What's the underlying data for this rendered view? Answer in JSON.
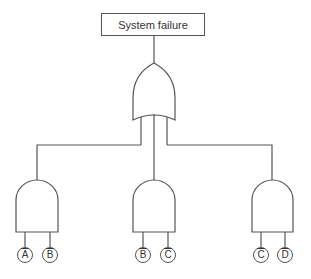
{
  "diagram": {
    "type": "fault-tree",
    "top_event": {
      "label": "System failure"
    },
    "or_gate": {
      "name": "or-gate",
      "inputs": 3
    },
    "and_gates": [
      {
        "name": "and-gate-1",
        "inputs": [
          {
            "label": "A",
            "negated": true
          },
          {
            "label": "B",
            "negated": true
          }
        ]
      },
      {
        "name": "and-gate-2",
        "inputs": [
          {
            "label": "B",
            "negated": true
          },
          {
            "label": "C",
            "negated": true
          }
        ]
      },
      {
        "name": "and-gate-3",
        "inputs": [
          {
            "label": "C",
            "negated": true
          },
          {
            "label": "D",
            "negated": true
          }
        ]
      }
    ],
    "colors": {
      "stroke": "#555555",
      "text": "#333333",
      "background": "#ffffff"
    }
  }
}
